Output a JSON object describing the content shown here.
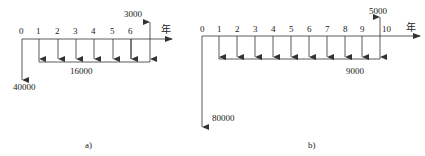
{
  "diagrams": [
    {
      "id": "a",
      "caption": "a)",
      "axis_unit": "年",
      "periods": [
        "0",
        "1",
        "2",
        "3",
        "4",
        "5",
        "6"
      ],
      "initial_outflow": "40000",
      "annual_outflow": "16000",
      "final_inflow": "3000"
    },
    {
      "id": "b",
      "caption": "b)",
      "axis_unit": "年",
      "periods": [
        "0",
        "1",
        "2",
        "3",
        "4",
        "5",
        "6",
        "7",
        "8",
        "9",
        "10"
      ],
      "initial_outflow": "80000",
      "annual_outflow": "9000",
      "final_inflow": "5000"
    }
  ],
  "colors": {
    "line": "#333333",
    "text": "#222222"
  }
}
